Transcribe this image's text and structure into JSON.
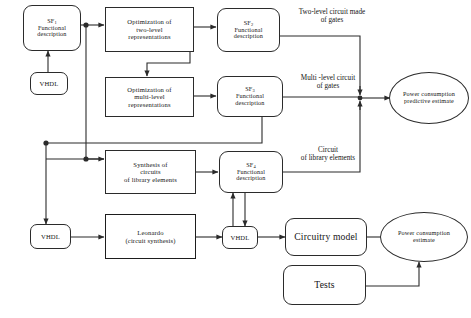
{
  "diagram": {
    "background": "#ffffff",
    "line_color": "#2b2b2b",
    "nodes": {
      "sf1": {
        "line1": "SF",
        "sub1": "1",
        "line2": "Functional",
        "line3": "description"
      },
      "vhdl_top": {
        "label": "VHDL"
      },
      "opt_two_level": {
        "line1": "Optimization of",
        "line2": "two-level",
        "line3": "representations"
      },
      "sf2": {
        "line1": "SF",
        "sub1": "2",
        "line2": "Functional",
        "line3": "description"
      },
      "opt_multi_level": {
        "line1": "Optimization of",
        "line2": "multi-level",
        "line3": "representations"
      },
      "sf3": {
        "line1": "SF",
        "sub1": "3",
        "line2": "Functional",
        "line3": "description"
      },
      "synthesis_library": {
        "line1": "Synthesis of",
        "line2": "circuits",
        "line3": "of library elements"
      },
      "sf4": {
        "line1": "SF",
        "sub1": "4",
        "line2": "Functional",
        "line3": "description"
      },
      "vhdl_bottom_left": {
        "label": "VHDL"
      },
      "leonardo": {
        "line1": "Leonardo",
        "line2": "(circuit synthesis)"
      },
      "vhdl_mid": {
        "label": "VHDL"
      },
      "circuitry_model": {
        "label": "Circuitry model"
      },
      "tests": {
        "label": "Tests"
      },
      "power_predictive": {
        "line1": "Power consumption",
        "line2": "predictive estimate"
      },
      "power_estimate": {
        "line1": "Power consumption",
        "line2": "estimate"
      }
    },
    "edge_labels": {
      "two_level_gates": {
        "line1": "Two-level circuit made",
        "line2": "of gates"
      },
      "multi_level_gates": {
        "line1": "Multi -level circuit",
        "line2": "of gates"
      },
      "library_circuit": {
        "line1": "Circuit",
        "line2": "of library elements"
      }
    }
  }
}
